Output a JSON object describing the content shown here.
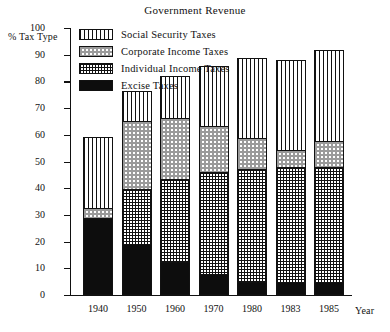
{
  "chart_data": {
    "type": "bar",
    "subtype": "stacked-bar",
    "title": "Government Revenue",
    "xlabel": "Year",
    "ylabel": "% Tax Type",
    "ylim": [
      0,
      100
    ],
    "yticks": [
      0,
      10,
      20,
      30,
      40,
      50,
      60,
      70,
      80,
      90,
      100
    ],
    "grid": false,
    "legend_position": "upper-left-inside",
    "categories": [
      "1940",
      "1950",
      "1960",
      "1970",
      "1980",
      "1983",
      "1985"
    ],
    "stack_order_bottom_to_top": [
      "Excise Taxes",
      "Individual Income Taxes",
      "Corporate Income Taxes",
      "Social Security Taxes"
    ],
    "series": [
      {
        "name": "Excise Taxes",
        "values": [
          29,
          19,
          12.5,
          8,
          5,
          5,
          5
        ]
      },
      {
        "name": "Individual Income Taxes",
        "values": [
          0,
          21,
          31.5,
          38.5,
          42.5,
          43.5,
          43.5
        ]
      },
      {
        "name": "Corporate Income Taxes",
        "values": [
          4,
          26,
          23,
          17.5,
          12,
          6.5,
          10
        ]
      },
      {
        "name": "Social Security Taxes",
        "values": [
          27,
          11.5,
          16,
          23,
          30.5,
          34,
          34.5
        ]
      }
    ],
    "cumulative_tops": [
      [
        29,
        29,
        33,
        60
      ],
      [
        19,
        40,
        66,
        77.5
      ],
      [
        12.5,
        44,
        67,
        83
      ],
      [
        8,
        46.5,
        64,
        87
      ],
      [
        5,
        47.5,
        59.5,
        90
      ],
      [
        5,
        48.5,
        55,
        89
      ],
      [
        5,
        48.5,
        58.5,
        93
      ]
    ],
    "totals": [
      60,
      77.5,
      83,
      87,
      90,
      89,
      93
    ]
  },
  "legend": {
    "items": [
      {
        "label": "Social Security Taxes",
        "pattern": "vertical-stripes"
      },
      {
        "label": "Corporate Income Taxes",
        "pattern": "light-checker"
      },
      {
        "label": "Individual Income Taxes",
        "pattern": "dense-crosshatch"
      },
      {
        "label": "Excise Taxes",
        "pattern": "solid-black"
      }
    ]
  }
}
